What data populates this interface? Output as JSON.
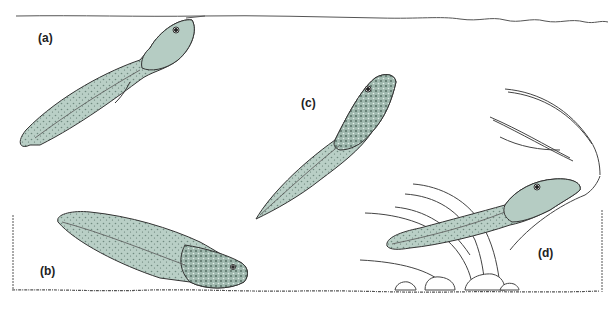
{
  "figure": {
    "colors": {
      "background": "#ffffff",
      "line": "#333333",
      "tadpole_fill": "#b9cfc6",
      "tadpole_fill_dark": "#8fa89e",
      "plant_line": "#444444"
    },
    "panels": [
      {
        "id": "a",
        "label": "(a)",
        "subject": "tadpole hanging from water surface"
      },
      {
        "id": "b",
        "label": "(b)",
        "subject": "tadpole resting on bottom"
      },
      {
        "id": "c",
        "label": "(c)",
        "subject": "tadpole swimming mid-water"
      },
      {
        "id": "d",
        "label": "(d)",
        "subject": "tadpole among aquatic plants"
      }
    ]
  }
}
